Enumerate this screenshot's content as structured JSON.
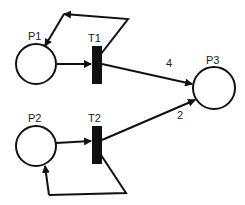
{
  "diagram": {
    "type": "petri-net",
    "places": [
      {
        "id": "P1",
        "label": "P1"
      },
      {
        "id": "P2",
        "label": "P2"
      },
      {
        "id": "P3",
        "label": "P3"
      }
    ],
    "transitions": [
      {
        "id": "T1",
        "label": "T1"
      },
      {
        "id": "T2",
        "label": "T2"
      }
    ],
    "arcs": [
      {
        "from": "P1",
        "to": "T1",
        "weight": ""
      },
      {
        "from": "T1",
        "to": "P1",
        "weight": ""
      },
      {
        "from": "T1",
        "to": "P3",
        "weight": "4"
      },
      {
        "from": "P2",
        "to": "T2",
        "weight": ""
      },
      {
        "from": "T2",
        "to": "P2",
        "weight": ""
      },
      {
        "from": "T2",
        "to": "P3",
        "weight": "2"
      }
    ]
  }
}
